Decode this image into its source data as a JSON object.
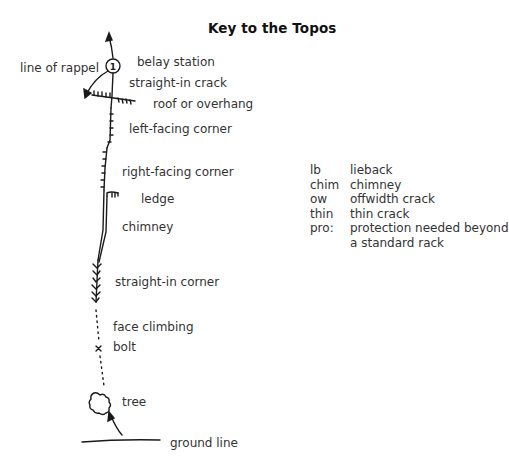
{
  "title": "Key to the Topos",
  "symbols": [
    {
      "id": "belay-station",
      "label": "belay station"
    },
    {
      "id": "line-of-rappel",
      "label": "line of rappel"
    },
    {
      "id": "straight-in-crack",
      "label": "straight-in crack"
    },
    {
      "id": "roof-or-overhang",
      "label": "roof or overhang"
    },
    {
      "id": "left-facing-corner",
      "label": "left-facing corner"
    },
    {
      "id": "right-facing-corner",
      "label": "right-facing corner"
    },
    {
      "id": "ledge",
      "label": "ledge"
    },
    {
      "id": "chimney",
      "label": "chimney"
    },
    {
      "id": "straight-in-corner",
      "label": "straight-in corner"
    },
    {
      "id": "face-climbing",
      "label": "face climbing"
    },
    {
      "id": "bolt",
      "label": "bolt"
    },
    {
      "id": "tree",
      "label": "tree"
    },
    {
      "id": "ground-line",
      "label": "ground line"
    }
  ],
  "belay_number": "1",
  "abbreviations": [
    {
      "abbr": "lb",
      "meaning": "lieback"
    },
    {
      "abbr": "chim",
      "meaning": "chimney"
    },
    {
      "abbr": "ow",
      "meaning": "offwidth crack"
    },
    {
      "abbr": "thin",
      "meaning": "thin crack"
    },
    {
      "abbr": "pro:",
      "meaning": "protection needed beyond"
    },
    {
      "abbr": "",
      "meaning": "a standard rack"
    }
  ]
}
